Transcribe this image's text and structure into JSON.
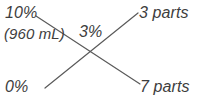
{
  "diagram": {
    "type": "alligation",
    "canvas": {
      "width": 208,
      "height": 98,
      "background": "#ffffff"
    },
    "text_color": "#3d3d3d",
    "line_color": "#5a5a5a",
    "labels": {
      "high_strength": "10%",
      "high_volume": "(960 mL)",
      "low_strength": "0%",
      "desired_strength": "3%",
      "high_parts": "3 parts",
      "low_parts": "7 parts"
    },
    "lines": [
      {
        "name": "high-strength-to-low-parts",
        "from_label": "high_strength",
        "to_label": "low_parts",
        "x1": 36,
        "y1": 16,
        "x2": 140,
        "y2": 84
      },
      {
        "name": "low-strength-to-high-parts",
        "from_label": "low_strength",
        "to_label": "high_parts",
        "x1": 45,
        "y1": 88,
        "x2": 138,
        "y2": 13
      }
    ],
    "crossing_point": {
      "x": 96,
      "y": 52
    }
  }
}
